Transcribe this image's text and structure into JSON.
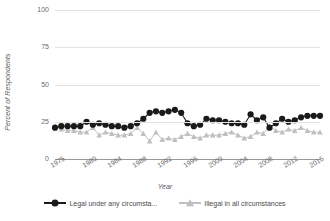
{
  "chart_data": {
    "type": "line",
    "title": "",
    "xlabel": "Year",
    "ylabel": "Percent of Respondents",
    "ylim": [
      0,
      100
    ],
    "xlim": [
      1975,
      2017
    ],
    "yticks": [
      0,
      25,
      50,
      75,
      100
    ],
    "xticks": [
      1975,
      1980,
      1984,
      1988,
      1992,
      1996,
      2000,
      2004,
      2008,
      2012,
      2016
    ],
    "grid": "horizontal",
    "legend_position": "bottom",
    "colors": {
      "legal_under_any": "#1a1a1a",
      "illegal_in_all": "#bfbfbf",
      "gridline": "#e2e2e2",
      "axis": "#9a9a9a",
      "text": "#5a5a5a"
    },
    "series": [
      {
        "name": "Legal under any circumsta...",
        "name_full": "Legal under any circumstances",
        "marker": "circle",
        "color": "#1a1a1a",
        "x": [
          1975,
          1976,
          1977,
          1978,
          1979,
          1980,
          1981,
          1982,
          1983,
          1984,
          1985,
          1986,
          1987,
          1988,
          1989,
          1990,
          1991,
          1992,
          1993,
          1994,
          1995,
          1996,
          1997,
          1998,
          1999,
          2000,
          2001,
          2002,
          2003,
          2004,
          2005,
          2006,
          2007,
          2008,
          2009,
          2010,
          2011,
          2012,
          2013,
          2014,
          2015,
          2016,
          2017
        ],
        "y": [
          21,
          22,
          22,
          22,
          22,
          25,
          23,
          24,
          23,
          22,
          22,
          21,
          22,
          24,
          27,
          31,
          32,
          31,
          32,
          33,
          31,
          24,
          22,
          23,
          27,
          26,
          26,
          25,
          24,
          24,
          23,
          30,
          26,
          28,
          21,
          24,
          27,
          25,
          26,
          28,
          29,
          29,
          29
        ]
      },
      {
        "name": "Illegal in all circumstances",
        "name_full": "Illegal in all circumstances",
        "marker": "triangle",
        "color": "#bfbfbf",
        "x": [
          1975,
          1976,
          1977,
          1978,
          1979,
          1980,
          1981,
          1982,
          1983,
          1984,
          1985,
          1986,
          1987,
          1988,
          1989,
          1990,
          1991,
          1992,
          1993,
          1994,
          1995,
          1996,
          1997,
          1998,
          1999,
          2000,
          2001,
          2002,
          2003,
          2004,
          2005,
          2006,
          2007,
          2008,
          2009,
          2010,
          2011,
          2012,
          2013,
          2014,
          2015,
          2016,
          2017
        ],
        "y": [
          22,
          20,
          19,
          19,
          18,
          18,
          21,
          16,
          18,
          17,
          16,
          16,
          17,
          21,
          17,
          12,
          18,
          13,
          14,
          13,
          15,
          17,
          15,
          14,
          16,
          16,
          16,
          17,
          18,
          16,
          14,
          15,
          18,
          17,
          22,
          19,
          18,
          20,
          19,
          21,
          19,
          18,
          18
        ]
      }
    ]
  },
  "axis": {
    "y_title": "Percent of Respondents",
    "x_title": "Year",
    "y_tick_labels": [
      "100",
      "75",
      "50",
      "25",
      "0"
    ],
    "x_tick_labels": [
      "1975",
      "1980",
      "1984",
      "1988",
      "1992",
      "1996",
      "2000",
      "2004",
      "2008",
      "2012",
      "2016"
    ]
  },
  "legend": {
    "items": [
      {
        "label": "Legal under any circumsta...",
        "marker": "circle-marker",
        "color": "#1a1a1a"
      },
      {
        "label": "Illegal in all circumstances",
        "marker": "triangle-marker",
        "color": "#bfbfbf"
      }
    ]
  }
}
